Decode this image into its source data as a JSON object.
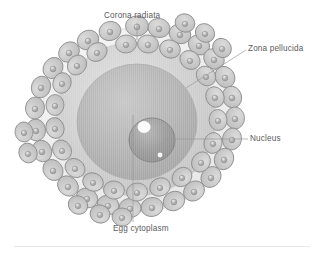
{
  "figure": {
    "background_color": "#ffffff",
    "label_color": "#5b5b5b",
    "divider_color": "#e7e7e7"
  },
  "labels": [
    {
      "id": "corona-radiata",
      "text": "Corona radiata",
      "position": "top",
      "leader": "vertical line down to outer cell layer"
    },
    {
      "id": "zona-pellucida",
      "text": "Zona pellucida",
      "position": "top-right",
      "leader": "diagonal line down-left to clear ring"
    },
    {
      "id": "nucleus",
      "text": "Nucleus",
      "position": "right",
      "leader": "horizontal line left to dark inner sphere"
    },
    {
      "id": "egg-cytoplasm",
      "text": "Egg cytoplasm",
      "position": "bottom",
      "leader": "vertical line up into grey interior"
    }
  ],
  "structures": {
    "corona_radiata": {
      "description": "ring of irregular follicle cells surrounding the egg",
      "cell_fill": "#c9c9c9",
      "cell_stroke": "#8c8c8c",
      "nucleus_fill": "#9a9a9a",
      "cell_count": 44
    },
    "zona_pellucida": {
      "description": "pale glycoprotein ring just inside the corona radiata",
      "fill": "#eeeeee",
      "stroke": "#d2d2d2"
    },
    "egg_cytoplasm": {
      "description": "granular grey interior of the ovum",
      "outer_fill": "#d9d9d9",
      "inner_fill": "#b3b3b3"
    },
    "nucleus": {
      "description": "dark sphere with bright highlight offset from centre",
      "fill": "#9b9b9b",
      "stroke": "#7c7c7c",
      "highlight": "#ffffff"
    }
  }
}
